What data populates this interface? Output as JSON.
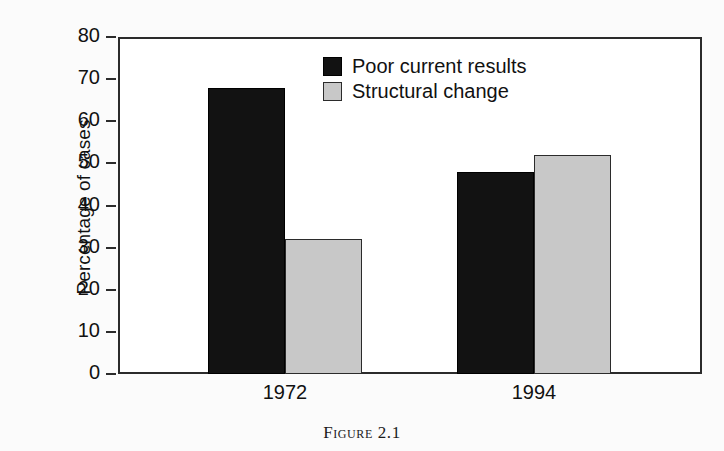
{
  "chart_data": {
    "type": "bar",
    "title": "",
    "categories": [
      "1972",
      "1994"
    ],
    "series": [
      {
        "name": "Poor current results",
        "values": [
          68,
          48
        ],
        "color": "#121212"
      },
      {
        "name": "Structural change",
        "values": [
          32,
          52
        ],
        "color": "#c8c8c8"
      }
    ],
    "xlabel": "",
    "ylabel": "Percentage of cases",
    "ylim": [
      0,
      80
    ],
    "yticks": [
      0,
      10,
      20,
      30,
      40,
      50,
      60,
      70,
      80
    ],
    "ytick_labels": [
      "0",
      "10",
      "20",
      "30",
      "40",
      "50",
      "60",
      "70",
      "80"
    ],
    "grid": false,
    "legend_position": "top-center"
  },
  "axis": {
    "y_title": "Percentage of cases",
    "y_tick_labels": [
      "80",
      "70",
      "60",
      "50",
      "40",
      "30",
      "20",
      "10",
      "0"
    ],
    "x_tick_labels": [
      "1972",
      "1994"
    ]
  },
  "legend": {
    "entries": [
      {
        "label": "Poor current results",
        "swatch": "black-square-swatch"
      },
      {
        "label": "Structural change",
        "swatch": "gray-square-swatch"
      }
    ]
  },
  "caption": {
    "text": "Figure 2.1"
  },
  "colors": {
    "series_black": "#121212",
    "series_gray": "#c8c8c8",
    "frame": "#2b2b2b",
    "background": "#fbfbfb",
    "text": "#111111"
  }
}
